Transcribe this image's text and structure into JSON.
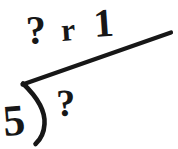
{
  "image": {
    "kind": "long-division-worksheet-problem",
    "background_color": "#ffffff",
    "ink_color": "#171717",
    "width": 178,
    "height": 149
  },
  "problem": {
    "divisor": "5",
    "dividend": "?",
    "quotient": "?",
    "remainder_label": "r",
    "remainder_value": "1",
    "quotient_line": "? r 1"
  },
  "marks": {
    "vinculum_name": "vinculum-line",
    "bracket_name": "division-bracket"
  }
}
